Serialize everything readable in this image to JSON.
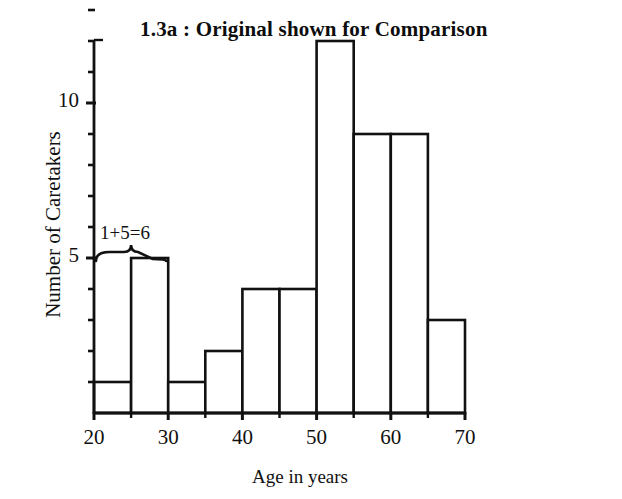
{
  "chart_data": {
    "type": "bar",
    "title": "1.3a : Original shown for Comparison",
    "xlabel": "Age in years",
    "ylabel": "Number of Caretakers",
    "bin_width": 5,
    "categories": [
      "20-25",
      "25-30",
      "30-35",
      "35-40",
      "40-45",
      "45-50",
      "50-55",
      "55-60",
      "60-65",
      "65-70"
    ],
    "bin_edges": [
      20,
      25,
      30,
      35,
      40,
      45,
      50,
      55,
      60,
      65,
      70
    ],
    "values": [
      1,
      5,
      1,
      2,
      4,
      4,
      12,
      9,
      9,
      3
    ],
    "xlim": [
      20,
      70
    ],
    "ylim": [
      0,
      13
    ],
    "x_tick_labels": [
      "20",
      "30",
      "40",
      "50",
      "60",
      "70"
    ],
    "x_tick_label_values": [
      20,
      30,
      40,
      50,
      60,
      70
    ],
    "x_minor_ticks": [
      25,
      35,
      45,
      55,
      65
    ],
    "y_tick_labels": [
      "5",
      "10"
    ],
    "y_tick_label_values": [
      5,
      10
    ],
    "y_minor_ticks": [
      1,
      2,
      3,
      4,
      6,
      7,
      8,
      9,
      11,
      12,
      13
    ],
    "grid": false,
    "legend": null,
    "annotations": [
      {
        "text": "1+5=6",
        "spans_bins": [
          "20-25",
          "25-30"
        ],
        "span_x_range": [
          20,
          30
        ],
        "kind": "brace-label"
      }
    ],
    "colors": {
      "line": "#111111",
      "bar_fill": "#ffffff",
      "background": "#ffffff"
    }
  }
}
